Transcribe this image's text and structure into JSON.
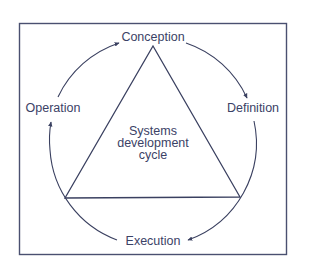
{
  "diagram": {
    "type": "cycle",
    "center_label": [
      "Systems",
      "development",
      "cycle"
    ],
    "stages": [
      {
        "id": "conception",
        "label": "Conception",
        "position": "top"
      },
      {
        "id": "definition",
        "label": "Definition",
        "position": "right"
      },
      {
        "id": "execution",
        "label": "Execution",
        "position": "bottom"
      },
      {
        "id": "operation",
        "label": "Operation",
        "position": "left"
      }
    ],
    "flow": [
      "Conception",
      "Definition",
      "Execution",
      "Operation",
      "Conception"
    ],
    "direction": "clockwise",
    "colors": {
      "line": "#3a4060",
      "text": "#3b4266",
      "background": "#ffffff"
    }
  }
}
